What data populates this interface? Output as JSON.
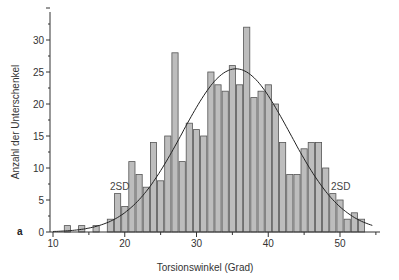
{
  "chart_data": {
    "type": "bar",
    "title": "",
    "panel_label": "a",
    "xlabel": "Torsionswinkel (Grad)",
    "ylabel": "Anzahl der Unterschenkel",
    "xlim": [
      10,
      55
    ],
    "ylim": [
      0,
      35
    ],
    "x_ticks": [
      10,
      20,
      30,
      40,
      50
    ],
    "y_ticks": [
      0,
      5,
      10,
      15,
      20,
      25,
      30
    ],
    "grid": false,
    "legend": null,
    "categories": [
      12,
      14,
      16,
      18,
      19,
      20,
      21,
      22,
      23,
      24,
      25,
      26,
      27,
      28,
      29,
      30,
      31,
      32,
      33,
      34,
      35,
      36,
      37,
      38,
      39,
      40,
      41,
      42,
      43,
      44,
      45,
      46,
      47,
      48,
      49,
      50,
      51,
      52,
      53
    ],
    "values": [
      1,
      1,
      1,
      2,
      6,
      4,
      11,
      9,
      7,
      14,
      8,
      15,
      28,
      11,
      17,
      16,
      15,
      25,
      23,
      22,
      26,
      23,
      32,
      21,
      22,
      23,
      20,
      14,
      9,
      9,
      13,
      14,
      14,
      10,
      6,
      5,
      2,
      3,
      2
    ],
    "overlay": {
      "type": "normal-curve",
      "mean": 35.5,
      "peak": 25.5,
      "sd": 7.5
    },
    "annotations": [
      {
        "text": "2SD",
        "x": 19.5,
        "y": 6.5
      },
      {
        "text": "2SD",
        "x": 50.5,
        "y": 6.5
      }
    ],
    "colors": {
      "bar_fill": "#bdbdbd",
      "bar_edge": "#555555",
      "curve": "#222222",
      "axis": "#333333"
    }
  }
}
